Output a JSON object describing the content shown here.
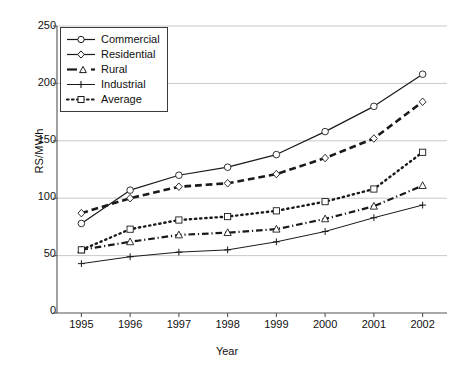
{
  "chart_data": {
    "type": "line",
    "title": "",
    "xlabel": "Year",
    "ylabel": "RS/MWh",
    "categories": [
      "1995",
      "1996",
      "1997",
      "1998",
      "1999",
      "2000",
      "2001",
      "2002"
    ],
    "x": [
      1995,
      1996,
      1997,
      1998,
      1999,
      2000,
      2001,
      2002
    ],
    "xlim": [
      1994.6,
      2002.4
    ],
    "ylim": [
      0,
      250
    ],
    "yticks": [
      0,
      50,
      100,
      150,
      200,
      250
    ],
    "ytick_labels": [
      "0",
      "50",
      "100",
      "150",
      "200",
      "250"
    ],
    "grid": "horizontal",
    "legend_position": "top-left",
    "series": [
      {
        "name": "Commercial",
        "marker": "circle-open",
        "line_style": "solid",
        "line_width": 1.2,
        "color": "#1a1a1a",
        "values": [
          78,
          107,
          120,
          127,
          138,
          158,
          180,
          208
        ]
      },
      {
        "name": "Residential",
        "marker": "diamond-open",
        "line_style": "dashed",
        "line_width": 2.6,
        "color": "#1a1a1a",
        "values": [
          87,
          100,
          110,
          113,
          121,
          135,
          152,
          184
        ]
      },
      {
        "name": "Rural",
        "marker": "triangle-open",
        "line_style": "dash-dot",
        "line_width": 2.2,
        "color": "#1a1a1a",
        "values": [
          55,
          62,
          68,
          70,
          73,
          82,
          93,
          111
        ]
      },
      {
        "name": "Industrial",
        "marker": "plus",
        "line_style": "solid",
        "line_width": 1.0,
        "color": "#1a1a1a",
        "values": [
          43,
          49,
          53,
          55,
          62,
          71,
          83,
          94
        ]
      },
      {
        "name": "Average",
        "marker": "square-open",
        "line_style": "dotted",
        "line_width": 2.4,
        "color": "#1a1a1a",
        "values": [
          55,
          73,
          81,
          84,
          89,
          97,
          108,
          140
        ]
      }
    ]
  },
  "axis": {
    "y_label": "RS/MWh",
    "x_label": "Year",
    "y_ticks": [
      "250",
      "200",
      "150",
      "100",
      "50",
      "0"
    ],
    "x_ticks": [
      "1995",
      "1996",
      "1997",
      "1998",
      "1999",
      "2000",
      "2001",
      "2002"
    ]
  },
  "legend": {
    "items": [
      {
        "label": "Commercial"
      },
      {
        "label": "Residential"
      },
      {
        "label": "Rural"
      },
      {
        "label": "Industrial"
      },
      {
        "label": "Average"
      }
    ]
  },
  "colors": {
    "ink": "#1a1a1a",
    "grid": "#c9c9c9",
    "background": "#ffffff"
  }
}
